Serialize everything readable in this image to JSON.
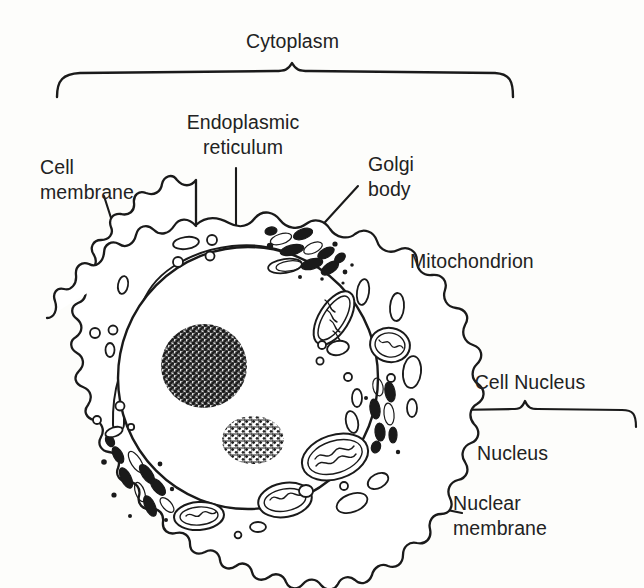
{
  "figure": {
    "background_color": "#fdfdfb",
    "ink_color": "#1a1a1a",
    "text_color": "#222222"
  },
  "labels": {
    "cytoplasm": "Cytoplasm",
    "endoplasmic_reticulum_line1": "Endoplasmic",
    "endoplasmic_reticulum_line2": "reticulum",
    "cell_membrane_line1": "Cell",
    "cell_membrane_line2": "membrane",
    "golgi_body_line1": "Golgi",
    "golgi_body_line2": "body",
    "mitochondrion": "Mitochondrion",
    "cell_nucleus": "Cell Nucleus",
    "nucleus": "Nucleus",
    "nuclear_membrane_line1": "Nuclear",
    "nuclear_membrane_line2": "membrane"
  },
  "structures": {
    "brackets": [
      {
        "name": "cytoplasm-bracket",
        "label": "Cytoplasm",
        "span_from": 57,
        "span_to": 512,
        "peak_x": 292
      },
      {
        "name": "cell-nucleus-bracket",
        "label": "Cell Nucleus",
        "span_from": 438,
        "span_to": 641,
        "peak_x": 525
      }
    ],
    "organelles": [
      {
        "name": "cell-membrane",
        "count": 1
      },
      {
        "name": "nuclear-membrane",
        "count": 1
      },
      {
        "name": "nucleus",
        "count": 1
      },
      {
        "name": "nucleolus",
        "count": 2
      },
      {
        "name": "endoplasmic-reticulum",
        "count": 1
      },
      {
        "name": "golgi-body",
        "count": 2
      },
      {
        "name": "mitochondrion",
        "count": 6
      },
      {
        "name": "vesicle",
        "count": 22
      }
    ]
  }
}
